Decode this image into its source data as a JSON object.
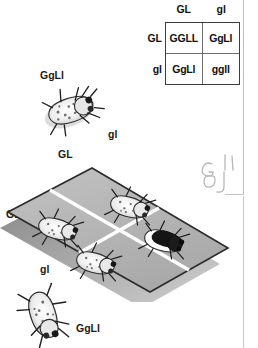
{
  "figure": {
    "type": "dihybrid-cross-punnett-square",
    "parent_top": {
      "genotype": "GgLl"
    },
    "parent_bottom": {
      "genotype": "GgLl"
    }
  },
  "punnett": {
    "column_headers": [
      "GL",
      "gl"
    ],
    "row_headers": [
      "GL",
      "gl"
    ],
    "cells": [
      {
        "genotype": "GGLL"
      },
      {
        "genotype": "GgLl"
      },
      {
        "genotype": "GgLl"
      },
      {
        "genotype": "ggll"
      }
    ]
  },
  "board": {
    "top_labels": [
      "GL",
      "gl"
    ],
    "left_labels": [
      "GL",
      "gl"
    ],
    "offspring": [
      {
        "cell": "top-left",
        "genotype": "GGLL",
        "phenotype": "gray-speckled"
      },
      {
        "cell": "top-right",
        "genotype": "GgLl",
        "phenotype": "gray-speckled"
      },
      {
        "cell": "bottom-left",
        "genotype": "GgLl",
        "phenotype": "gray-speckled"
      },
      {
        "cell": "bottom-right",
        "genotype": "ggll",
        "phenotype": "black-body"
      }
    ]
  },
  "annotation": {
    "handwritten": "GL gl"
  },
  "colors": {
    "board_fill": "#b7b7b7",
    "board_edge": "#2b2b2b",
    "board_shadow": "#8d8d8d",
    "divider": "#ffffff",
    "text": "#1b1b1b",
    "rule": "#b9bcc2",
    "handwriting": "#b5b7bd",
    "black_fly_body": "#151515"
  }
}
